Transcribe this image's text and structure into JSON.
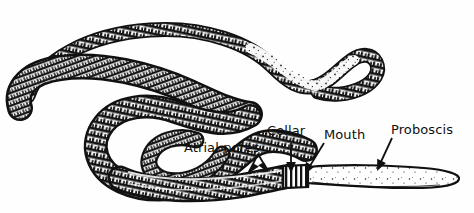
{
  "figure": {
    "kind": "pen-and-ink scientific illustration",
    "background_color": "#fefefe",
    "ink_color": "#111111"
  },
  "labels": [
    {
      "id": "atrial-pores",
      "text": "Atrial pores",
      "pointer": "forked-arrow",
      "pointer_direction": "down"
    },
    {
      "id": "collar",
      "text": "Collar",
      "pointer": "straight-arrow",
      "pointer_direction": "down"
    },
    {
      "id": "mouth",
      "text": "Mouth",
      "pointer": "straight-arrow",
      "pointer_direction": "down-left"
    },
    {
      "id": "proboscis",
      "text": "Proboscis",
      "pointer": "straight-arrow",
      "pointer_direction": "down-left"
    }
  ],
  "anatomy": {
    "trunk_label": "trunk",
    "tail_label": "posterior tail",
    "collar_label": "collar",
    "proboscis_label": "proboscis"
  }
}
